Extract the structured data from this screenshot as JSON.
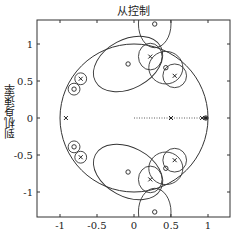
{
  "chart_data": {
    "type": "scatter",
    "title": "从控制",
    "xlabel": "",
    "ylabel": "到机身速率",
    "xlim": [
      -1.3,
      1.3
    ],
    "ylim": [
      -1.3,
      1.35
    ],
    "grid": false,
    "x_ticks": [
      -1,
      -0.5,
      0,
      0.5,
      1
    ],
    "x_tick_labels": [
      "-1",
      "-0.5",
      "0",
      "0.5",
      "1"
    ],
    "y_ticks": [
      -1,
      -0.5,
      0,
      0.5,
      1
    ],
    "y_tick_labels": [
      "-1",
      "-0.5",
      "0",
      "0.5",
      "1"
    ],
    "unit_circle": {
      "cx": 0,
      "cy": 0,
      "r": 1
    },
    "real_axis_segment": {
      "x_from": 0,
      "x_to": 1,
      "style": "dotted"
    },
    "series": [
      {
        "name": "poles",
        "marker": "x",
        "points": [
          [
            -0.92,
            0
          ],
          [
            0.5,
            0
          ],
          [
            0.92,
            0
          ],
          [
            0.22,
            0.83
          ],
          [
            0.22,
            -0.83
          ],
          [
            0.55,
            0.57
          ],
          [
            0.55,
            -0.57
          ],
          [
            -0.72,
            0.53
          ],
          [
            -0.72,
            -0.53
          ]
        ]
      },
      {
        "name": "zeros",
        "marker": "o",
        "points": [
          [
            0.28,
            1.27
          ],
          [
            0.28,
            -1.27
          ],
          [
            -0.08,
            0.73
          ],
          [
            -0.08,
            -0.73
          ],
          [
            0.43,
            0.68
          ],
          [
            0.43,
            -0.68
          ],
          [
            -0.81,
            0.39
          ],
          [
            -0.81,
            -0.39
          ],
          [
            0.97,
            0
          ]
        ]
      }
    ],
    "uncertainty_ellipses": [
      {
        "cx": 0.28,
        "cy": 1.27,
        "rx": 0.22,
        "ry": 0.32
      },
      {
        "cx": 0.28,
        "cy": -1.27,
        "rx": 0.22,
        "ry": 0.32
      },
      {
        "cx": -0.08,
        "cy": 0.73,
        "rx": 0.5,
        "ry": 0.33,
        "rot": -28
      },
      {
        "cx": -0.08,
        "cy": -0.73,
        "rx": 0.5,
        "ry": 0.33,
        "rot": 28
      },
      {
        "cx": 0.22,
        "cy": 0.83,
        "rx": 0.16,
        "ry": 0.18
      },
      {
        "cx": 0.22,
        "cy": -0.83,
        "rx": 0.16,
        "ry": 0.18
      },
      {
        "cx": 0.43,
        "cy": 0.68,
        "rx": 0.23,
        "ry": 0.22
      },
      {
        "cx": 0.43,
        "cy": -0.68,
        "rx": 0.23,
        "ry": 0.22
      },
      {
        "cx": 0.55,
        "cy": 0.57,
        "rx": 0.16,
        "ry": 0.16
      },
      {
        "cx": 0.55,
        "cy": -0.57,
        "rx": 0.16,
        "ry": 0.16
      },
      {
        "cx": -0.72,
        "cy": 0.53,
        "rx": 0.08,
        "ry": 0.08
      },
      {
        "cx": -0.72,
        "cy": -0.53,
        "rx": 0.08,
        "ry": 0.08
      },
      {
        "cx": -0.81,
        "cy": 0.39,
        "rx": 0.08,
        "ry": 0.08
      },
      {
        "cx": -0.81,
        "cy": -0.39,
        "rx": 0.08,
        "ry": 0.08
      }
    ],
    "axes_box_px": {
      "left": 37,
      "top": 20,
      "right": 230,
      "bottom": 217
    },
    "origin_px": {
      "x": 134,
      "y": 118
    },
    "px_per_unit": 74
  }
}
